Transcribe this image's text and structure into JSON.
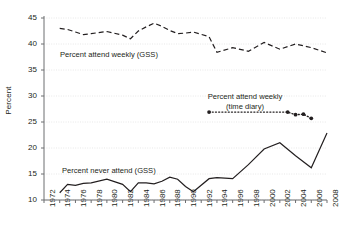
{
  "chart_data": {
    "type": "line",
    "title": "",
    "xlabel": "",
    "ylabel": "Percent",
    "xlim": [
      1972,
      2008
    ],
    "ylim": [
      10,
      45
    ],
    "ytick_labels": [
      "10",
      "15",
      "20",
      "25",
      "30",
      "35",
      "40",
      "45"
    ],
    "ytick_values": [
      10,
      15,
      20,
      25,
      30,
      35,
      40,
      45
    ],
    "xtick_labels": [
      "1972",
      "1974",
      "1976",
      "1978",
      "1980",
      "1982",
      "1984",
      "1986",
      "1988",
      "1990",
      "1992",
      "1994",
      "1996",
      "1998",
      "2000",
      "2002",
      "2004",
      "2006",
      "2008"
    ],
    "xtick_values": [
      1972,
      1974,
      1976,
      1978,
      1980,
      1982,
      1984,
      1986,
      1988,
      1990,
      1992,
      1994,
      1996,
      1998,
      2000,
      2002,
      2004,
      2006,
      2008
    ],
    "grid": true,
    "grid_axis": "y",
    "legend_position": "inline-annotations",
    "series": [
      {
        "name": "Percent attend weekly (GSS)",
        "style": "dashed",
        "color": "#231f20",
        "x": [
          1974,
          1975,
          1976,
          1977,
          1978,
          1980,
          1982,
          1983,
          1984,
          1985,
          1986,
          1987,
          1988,
          1989,
          1990,
          1991,
          1993,
          1994,
          1996,
          1998,
          2000,
          2002,
          2004,
          2006,
          2008
        ],
        "values": [
          43.0,
          42.8,
          42.3,
          41.8,
          42.0,
          42.4,
          41.7,
          41.0,
          42.5,
          43.3,
          44.0,
          43.4,
          42.6,
          42.0,
          42.1,
          42.3,
          41.4,
          38.4,
          39.3,
          38.6,
          40.3,
          39.0,
          40.0,
          39.3,
          38.3
        ]
      },
      {
        "name": "Percent attend weekly (time diary)",
        "style": "dotted",
        "color": "#231f20",
        "markers": true,
        "x": [
          1993,
          2003,
          2004,
          2005,
          2006
        ],
        "values": [
          26.9,
          26.9,
          26.4,
          26.5,
          25.7
        ]
      },
      {
        "name": "Percent never attend (GSS)",
        "style": "solid",
        "color": "#231f20",
        "x": [
          1974,
          1975,
          1976,
          1977,
          1978,
          1980,
          1982,
          1983,
          1984,
          1985,
          1986,
          1987,
          1988,
          1989,
          1990,
          1991,
          1993,
          1994,
          1996,
          1998,
          2000,
          2002,
          2004,
          2006,
          2008
        ],
        "values": [
          11.4,
          13.0,
          12.8,
          13.2,
          13.3,
          14.0,
          13.0,
          11.6,
          13.3,
          13.3,
          13.1,
          13.6,
          14.4,
          14.0,
          12.6,
          11.6,
          14.1,
          14.3,
          14.1,
          16.8,
          19.8,
          21.0,
          18.5,
          16.2,
          22.9
        ]
      }
    ],
    "annotations": [
      {
        "name": "attend-weekly-gss-label",
        "text": "Percent attend weekly (GSS)"
      },
      {
        "name": "attend-weekly-timediary-label-line1",
        "text": "Percent attend weekly"
      },
      {
        "name": "attend-weekly-timediary-label-line2",
        "text": "(time diary)"
      },
      {
        "name": "never-attend-gss-label",
        "text": "Percent never attend (GSS)"
      }
    ]
  }
}
